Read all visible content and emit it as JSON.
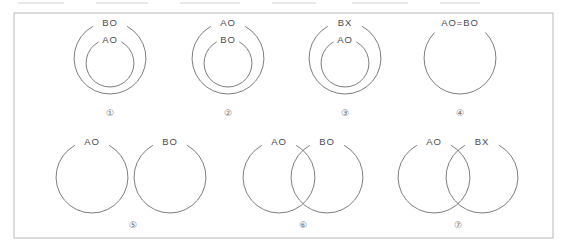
{
  "figure": {
    "background_color": "#ffffff",
    "frame_color": "#b9b9bd",
    "line_color": "#6e6e74",
    "text_color": "#4a4a50",
    "index_color": "#6b6b72",
    "width": 568,
    "height": 251
  },
  "diagrams": [
    {
      "index_label": "①",
      "index_x": 110,
      "index_y": 114,
      "kind": "concentric",
      "circles": [
        {
          "cx": 110,
          "cy": 58,
          "r": 36,
          "label": "BO",
          "label_x": 110,
          "label_y": 23
        },
        {
          "cx": 110,
          "cy": 63,
          "r": 24,
          "label": "AO",
          "label_x": 110,
          "label_y": 40
        }
      ]
    },
    {
      "index_label": "②",
      "index_x": 228,
      "index_y": 114,
      "kind": "concentric",
      "circles": [
        {
          "cx": 228,
          "cy": 58,
          "r": 36,
          "label": "AO",
          "label_x": 228,
          "label_y": 23
        },
        {
          "cx": 228,
          "cy": 63,
          "r": 24,
          "label": "BO",
          "label_x": 228,
          "label_y": 40
        }
      ]
    },
    {
      "index_label": "③",
      "index_x": 345,
      "index_y": 114,
      "kind": "concentric",
      "circles": [
        {
          "cx": 345,
          "cy": 58,
          "r": 36,
          "label": "BX",
          "label_x": 345,
          "label_y": 23
        },
        {
          "cx": 345,
          "cy": 63,
          "r": 24,
          "label": "AO",
          "label_x": 345,
          "label_y": 40
        }
      ]
    },
    {
      "index_label": "④",
      "index_x": 460,
      "index_y": 114,
      "kind": "single",
      "circles": [
        {
          "cx": 460,
          "cy": 58,
          "r": 36,
          "label": "AO=BO",
          "label_x": 460,
          "label_y": 23
        }
      ]
    },
    {
      "index_label": "⑤",
      "index_x": 133,
      "index_y": 226,
      "kind": "disjoint",
      "circles": [
        {
          "cx": 92,
          "cy": 177,
          "r": 36,
          "label": "AO",
          "label_x": 92,
          "label_y": 142
        },
        {
          "cx": 170,
          "cy": 177,
          "r": 36,
          "label": "BO",
          "label_x": 170,
          "label_y": 142
        }
      ]
    },
    {
      "index_label": "⑥",
      "index_x": 303,
      "index_y": 226,
      "kind": "overlapping",
      "circles": [
        {
          "cx": 279,
          "cy": 177,
          "r": 36,
          "label": "AO",
          "label_x": 279,
          "label_y": 142
        },
        {
          "cx": 327,
          "cy": 177,
          "r": 36,
          "label": "BO",
          "label_x": 327,
          "label_y": 142
        }
      ]
    },
    {
      "index_label": "⑦",
      "index_x": 458,
      "index_y": 226,
      "kind": "overlapping",
      "circles": [
        {
          "cx": 434,
          "cy": 177,
          "r": 36,
          "label": "AO",
          "label_x": 434,
          "label_y": 142
        },
        {
          "cx": 482,
          "cy": 177,
          "r": 36,
          "label": "BX",
          "label_x": 482,
          "label_y": 142
        }
      ]
    }
  ],
  "frame": {
    "x": 14,
    "y": 13,
    "width": 539,
    "height": 225
  }
}
